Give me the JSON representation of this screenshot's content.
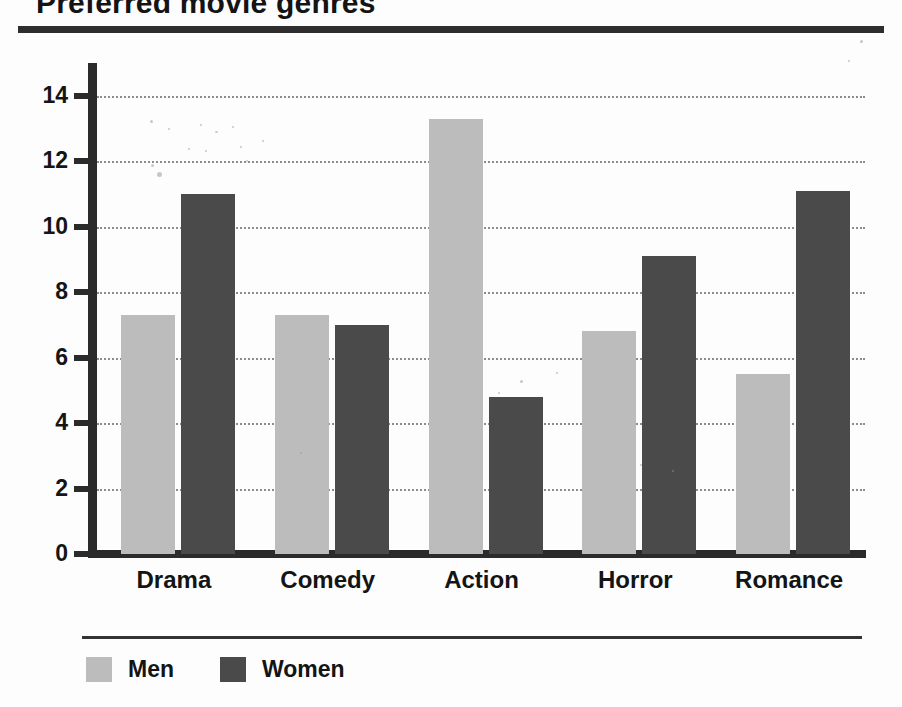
{
  "chart_data": {
    "type": "bar",
    "title": "Preferred movie genres",
    "xlabel": "",
    "ylabel": "",
    "categories": [
      "Drama",
      "Comedy",
      "Action",
      "Horror",
      "Romance"
    ],
    "series": [
      {
        "name": "Men",
        "color": "#bcbcbc",
        "values": [
          7.3,
          7.3,
          13.3,
          6.8,
          5.5
        ]
      },
      {
        "name": "Women",
        "color": "#4a4a4a",
        "values": [
          11.0,
          7.0,
          4.8,
          9.1,
          11.1
        ]
      }
    ],
    "ylim": [
      0,
      15
    ],
    "yticks": [
      0,
      2,
      4,
      6,
      8,
      10,
      12,
      14
    ],
    "ytick_labels": [
      "0",
      "2",
      "4",
      "6",
      "8",
      "10",
      "12",
      "14"
    ],
    "grid": true,
    "grid_style": "dotted-horizontal",
    "legend_position": "bottom-left"
  },
  "figure": {
    "background": "#fdfdfd",
    "axis_color": "#2b2b2b",
    "grid_color": "#8c8c8c",
    "title_rule_color": "#2e2e2e",
    "legend_rule_color": "#333333"
  }
}
